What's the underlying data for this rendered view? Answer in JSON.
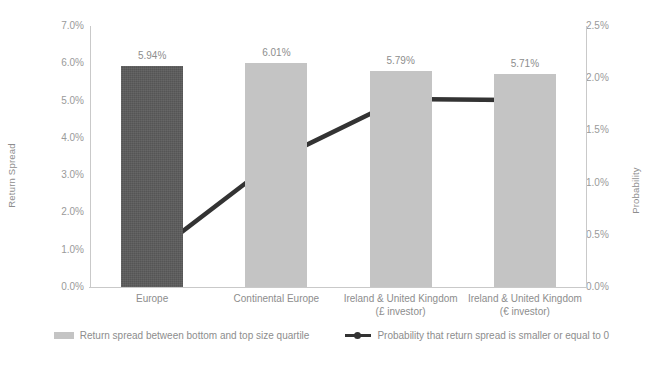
{
  "chart_data": {
    "type": "bar",
    "title": "",
    "categories": [
      "Europe",
      "Continental Europe",
      "Ireland & United Kingdom (£ investor)",
      "Ireland & United Kingdom (€ investor)"
    ],
    "category_lines": [
      [
        "Europe",
        ""
      ],
      [
        "Continental Europe",
        ""
      ],
      [
        "Ireland & United Kingdom",
        "(£ investor)"
      ],
      [
        "Ireland & United Kingdom",
        "(€ investor)"
      ]
    ],
    "series": [
      {
        "name": "Return spread between bottom and top size quartile",
        "type": "bar",
        "axis": "left",
        "color": "#c4c4c4",
        "highlight_color": "#5b5b5b",
        "highlight_index": 0,
        "values": [
          5.94,
          6.01,
          5.79,
          5.71
        ],
        "labels": [
          "5.94%",
          "6.01%",
          "5.79%",
          "5.71%"
        ]
      },
      {
        "name": "Probability that return spread is smaller or equal to 0",
        "type": "line",
        "axis": "right",
        "color": "#333333",
        "values": [
          0.31,
          1.22,
          1.8,
          1.79
        ]
      }
    ],
    "xlabel": "",
    "ylabel": "Return Spread",
    "y2label": "Probability",
    "ylim": [
      0,
      7
    ],
    "y2lim": [
      0,
      2.5
    ],
    "yticks": [
      "0.0%",
      "1.0%",
      "2.0%",
      "3.0%",
      "4.0%",
      "5.0%",
      "6.0%",
      "7.0%"
    ],
    "ytick_values": [
      0,
      1,
      2,
      3,
      4,
      5,
      6,
      7
    ],
    "y2ticks": [
      "0.0%",
      "0.5%",
      "1.0%",
      "1.5%",
      "2.0%",
      "2.5%"
    ],
    "y2tick_values": [
      0,
      0.5,
      1.0,
      1.5,
      2.0,
      2.5
    ],
    "grid": false,
    "legend_position": "bottom"
  },
  "axes": {
    "left_title": "Return Spread",
    "right_title": "Probability"
  },
  "legend": {
    "items": [
      {
        "label": "Return spread between bottom and top size quartile",
        "marker": "bar-swatch-icon"
      },
      {
        "label": "Probability that return spread is smaller or equal to 0",
        "marker": "line-marker-icon"
      }
    ]
  }
}
